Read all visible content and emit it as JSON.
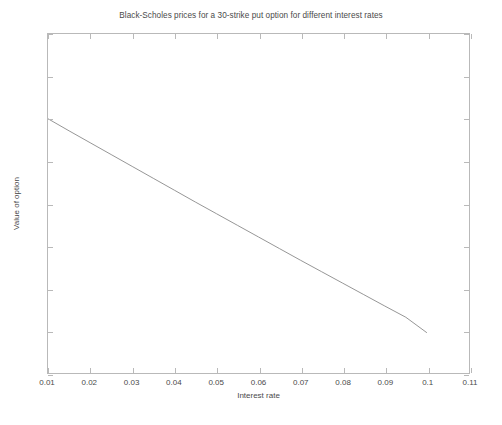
{
  "chart_data": {
    "type": "line",
    "title": "Black-Scholes prices for a 30-strike put option for different interest rates",
    "xlabel": "Interest rate",
    "ylabel": "Value of option",
    "xlim": [
      0.01,
      0.11
    ],
    "ylim": [
      4.4,
      6
    ],
    "grid": false,
    "legend": null,
    "xticks": [
      "0.01",
      "0.02",
      "0.03",
      "0.04",
      "0.05",
      "0.06",
      "0.07",
      "0.08",
      "0.09",
      "0.1",
      "0.11"
    ],
    "xtick_values": [
      0.01,
      0.02,
      0.03,
      0.04,
      0.05,
      0.06,
      0.07,
      0.08,
      0.09,
      0.1,
      0.11
    ],
    "yticks": [
      "4.4",
      "4.6",
      "4.8",
      "5",
      "5.2",
      "5.4",
      "5.6",
      "5.8",
      "6"
    ],
    "ytick_values": [
      4.4,
      4.6,
      4.8,
      5.0,
      5.2,
      5.4,
      5.6,
      5.8,
      6.0
    ],
    "series": [
      {
        "name": "Black-Scholes put value",
        "color": "#8a8a8a",
        "x": [
          0.01,
          0.015,
          0.02,
          0.025,
          0.03,
          0.035,
          0.04,
          0.045,
          0.05,
          0.055,
          0.06,
          0.065,
          0.07,
          0.075,
          0.08,
          0.085,
          0.09,
          0.095,
          0.1
        ],
        "y": [
          5.6,
          5.543,
          5.487,
          5.431,
          5.375,
          5.319,
          5.263,
          5.207,
          5.152,
          5.097,
          5.042,
          4.987,
          4.932,
          4.878,
          4.824,
          4.77,
          4.716,
          4.663,
          4.59
        ]
      }
    ]
  },
  "axes": {
    "frame_color": "#b9b9b9",
    "text_color": "#4a4a4a"
  }
}
